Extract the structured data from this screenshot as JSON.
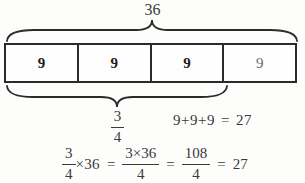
{
  "figure": {
    "total_label": "36",
    "cells": [
      {
        "value": "9"
      },
      {
        "value": "9"
      },
      {
        "value": "9"
      },
      {
        "value": "9"
      }
    ],
    "brace_fraction": {
      "num": "3",
      "den": "4"
    },
    "sum_equation": {
      "terms": "9+9+9",
      "equals": "=",
      "result": "27"
    },
    "product_equation": {
      "frac1_num": "3",
      "frac1_den": "4",
      "times_term": "×36",
      "equals1": "=",
      "frac2_num": "3×36",
      "frac2_den": "4",
      "equals2": "=",
      "frac3_num": "108",
      "frac3_den": "4",
      "equals3": "=",
      "result": "27"
    },
    "colors": {
      "line": "#2b2b2b",
      "text": "#3a3a3a",
      "cell_bold": "#1a1a1a",
      "cell_light": "#6a6a6a",
      "background": "#fdfdfc"
    }
  }
}
